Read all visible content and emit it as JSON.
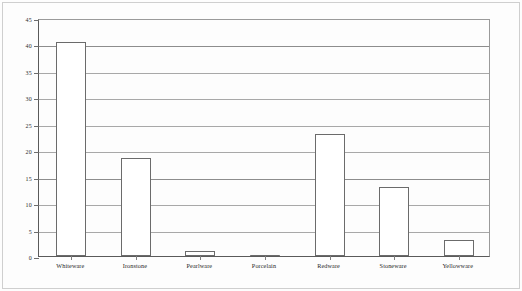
{
  "chart_data": {
    "type": "bar",
    "title": "",
    "subtitle": "",
    "xlabel": "",
    "ylabel": "",
    "ylim": [
      0,
      45
    ],
    "ytick_interval": 5,
    "yticks": [
      "0",
      "5",
      "10",
      "15",
      "20",
      "25",
      "30",
      "35",
      "40",
      "45"
    ],
    "grid": true,
    "grid_orientation": "horizontal",
    "legend": false,
    "legend_position": "none",
    "categories": [
      "Whiteware",
      "Ironstone",
      "Pearlware",
      "Porcelain",
      "Redware",
      "Stoneware",
      "Yellowware"
    ],
    "values": [
      40.5,
      18.5,
      1,
      0.2,
      23,
      13,
      3
    ],
    "bar_style": {
      "fill": "#ffffff",
      "edge": "#6b6b6b"
    }
  },
  "figure": {
    "axis_color": "#5a5a5a",
    "gridline_color": "#a8a8a8",
    "background": "#ffffff"
  }
}
